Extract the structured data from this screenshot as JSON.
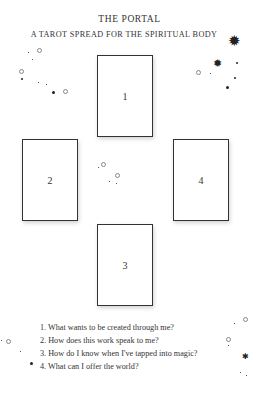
{
  "header": {
    "title": "THE PORTAL",
    "subtitle": "A TAROT SPREAD FOR THE SPIRITUAL BODY"
  },
  "cards": [
    {
      "label": "1",
      "position": "top"
    },
    {
      "label": "2",
      "position": "left"
    },
    {
      "label": "3",
      "position": "bottom"
    },
    {
      "label": "4",
      "position": "right"
    }
  ],
  "questions": [
    "1. What wants to be created through me?",
    "2. How does this work speak to me?",
    "3. How do I know when I've tapped into magic?",
    "4. What can I offer the world?"
  ],
  "decorations": {
    "star_glyph": "✹",
    "sparkle_color": "#222222"
  }
}
